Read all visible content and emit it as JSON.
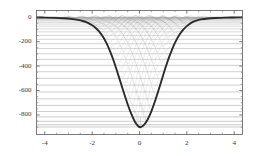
{
  "chart_data": {
    "type": "line",
    "title": "",
    "xlabel": "",
    "ylabel": "",
    "xlim": [
      -4.35,
      4.35
    ],
    "ylim": [
      -960,
      55
    ],
    "grid": false,
    "legend": null,
    "x_ticks": [
      -4,
      -2,
      0,
      2,
      4
    ],
    "x_tick_labels": [
      "-4",
      "-2",
      "0",
      "2",
      "4"
    ],
    "y_ticks": [
      0,
      -200,
      -400,
      -600,
      -800
    ],
    "y_tick_labels": [
      "0",
      "-200",
      "-400",
      "-600",
      "-800"
    ],
    "frame": true,
    "series": [
      {
        "name": "potential-well",
        "role": "potential",
        "color": "#2b2b2b",
        "width": 1.9,
        "description": "deep symmetric potential well, minimum about -900 near x=0",
        "minimum_value": -900,
        "minimum_x": 0.05,
        "x": [
          -4.35,
          -4.0,
          -3.6,
          -3.2,
          -2.9,
          -2.6,
          -2.4,
          -2.2,
          -2.0,
          -1.85,
          -1.7,
          -1.55,
          -1.4,
          -1.25,
          -1.1,
          -0.95,
          -0.8,
          -0.65,
          -0.5,
          -0.35,
          -0.2,
          -0.05,
          0.05,
          0.2,
          0.35,
          0.5,
          0.65,
          0.8,
          0.95,
          1.1,
          1.25,
          1.4,
          1.55,
          1.7,
          1.85,
          2.0,
          2.2,
          2.4,
          2.6,
          2.9,
          3.2,
          3.6,
          4.0,
          4.35
        ],
        "y": [
          -2,
          -3,
          -5,
          -9,
          -14,
          -22,
          -31,
          -45,
          -66,
          -88,
          -118,
          -158,
          -210,
          -275,
          -352,
          -440,
          -532,
          -625,
          -712,
          -790,
          -853,
          -892,
          -900,
          -880,
          -835,
          -770,
          -690,
          -600,
          -505,
          -412,
          -327,
          -252,
          -190,
          -140,
          -102,
          -73,
          -44,
          -28,
          -18,
          -10,
          -6,
          -3,
          -2,
          -1
        ]
      },
      {
        "name": "energy-levels",
        "role": "eigenvalues",
        "color": "#8e8e8e",
        "width": 0.55,
        "description": "horizontal eigenenergy lines spanning the frame, spacing converging toward E=0",
        "count": 30,
        "values": [
          -898,
          -880,
          -852,
          -816,
          -772,
          -722,
          -668,
          -612,
          -556,
          -500,
          -446,
          -394,
          -345,
          -299,
          -256,
          -217,
          -181,
          -149,
          -120,
          -95,
          -74,
          -56,
          -42,
          -30,
          -21,
          -14,
          -9,
          -5,
          -2.5,
          -1.0
        ]
      },
      {
        "name": "wavefunctions",
        "role": "eigenfunctions",
        "color": "#b4b4b4",
        "width": 0.5,
        "description": "light gray eigenfunction lobes drawn at each energy level forming a crosshatch inside the well",
        "count": 30
      }
    ]
  }
}
